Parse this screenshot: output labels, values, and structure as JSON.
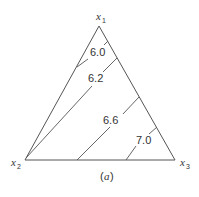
{
  "diagram": {
    "type": "ternary-contour",
    "vertices": {
      "top": {
        "var": "x",
        "sub": "1"
      },
      "left": {
        "var": "x",
        "sub": "2"
      },
      "right": {
        "var": "x",
        "sub": "3"
      }
    },
    "contours": [
      {
        "label": "6.0"
      },
      {
        "label": "6.2"
      },
      {
        "label": "6.6"
      },
      {
        "label": "7.0"
      }
    ],
    "caption": {
      "open": "(",
      "letter": "a",
      "close": ")"
    },
    "colors": {
      "line": "#555555",
      "text": "#333333",
      "background": "#ffffff"
    }
  }
}
